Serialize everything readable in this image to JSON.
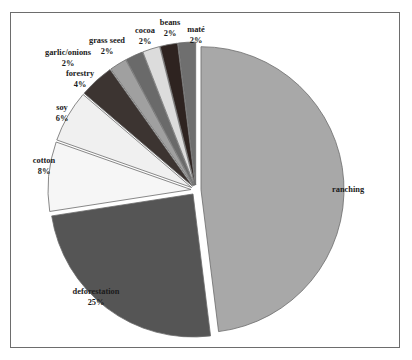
{
  "figure": {
    "background_color": "#ffffff",
    "border_color": "#6d6d6d"
  },
  "chart_data": {
    "type": "pie",
    "title": "",
    "subtitle": "",
    "xlabel": "",
    "ylabel": "",
    "legend_position": "none",
    "grid": false,
    "exploded": true,
    "start_angle_deg": 0,
    "direction": "clockwise",
    "center": {
      "x": 196,
      "y": 190
    },
    "radius": 143,
    "categories": [
      "ranching",
      "deforestation",
      "cotton",
      "soy",
      "forestry",
      "garlic/onions",
      "grass seed",
      "cocoa",
      "beans",
      "maté"
    ],
    "values": [
      49,
      25,
      8,
      6,
      4,
      2,
      2,
      2,
      2,
      2
    ],
    "slices": [
      {
        "label": "ranching",
        "percent_text": "",
        "value": 49,
        "color": "#a8a8a8",
        "label_x": 332,
        "label_y": 190,
        "pct_x": 332,
        "pct_y": 200,
        "anchor": "start"
      },
      {
        "label": "deforestation",
        "percent_text": "25%",
        "value": 25,
        "color": "#555555",
        "label_x": 96,
        "label_y": 292,
        "pct_x": 96,
        "pct_y": 303,
        "anchor": "middle"
      },
      {
        "label": "cotton",
        "percent_text": "8%",
        "value": 8,
        "color": "#f6f6f6",
        "label_x": 44,
        "label_y": 161,
        "pct_x": 44,
        "pct_y": 172,
        "anchor": "middle"
      },
      {
        "label": "soy",
        "percent_text": "6%",
        "value": 6,
        "color": "#f0f0f0",
        "label_x": 62,
        "label_y": 108,
        "pct_x": 62,
        "pct_y": 119,
        "anchor": "middle"
      },
      {
        "label": "forestry",
        "percent_text": "4%",
        "value": 4,
        "color": "#3c3431",
        "label_x": 80,
        "label_y": 74,
        "pct_x": 80,
        "pct_y": 85,
        "anchor": "middle"
      },
      {
        "label": "garlic/onions",
        "percent_text": "2%",
        "value": 2,
        "color": "#a0a0a0",
        "label_x": 68,
        "label_y": 53,
        "pct_x": 68,
        "pct_y": 64,
        "anchor": "middle"
      },
      {
        "label": "grass seed",
        "percent_text": "2%",
        "value": 2,
        "color": "#6a6a6a",
        "label_x": 107,
        "label_y": 41,
        "pct_x": 107,
        "pct_y": 52,
        "anchor": "middle"
      },
      {
        "label": "cocoa",
        "percent_text": "2%",
        "value": 2,
        "color": "#dcdcdc",
        "label_x": 145,
        "label_y": 31,
        "pct_x": 145,
        "pct_y": 42,
        "anchor": "middle"
      },
      {
        "label": "beans",
        "percent_text": "2%",
        "value": 2,
        "color": "#2e2320",
        "label_x": 170,
        "label_y": 23,
        "pct_x": 170,
        "pct_y": 34,
        "anchor": "middle"
      },
      {
        "label": "maté",
        "percent_text": "2%",
        "value": 2,
        "color": "#6f6f6f",
        "label_x": 196,
        "label_y": 30,
        "pct_x": 196,
        "pct_y": 41,
        "anchor": "middle"
      }
    ]
  }
}
